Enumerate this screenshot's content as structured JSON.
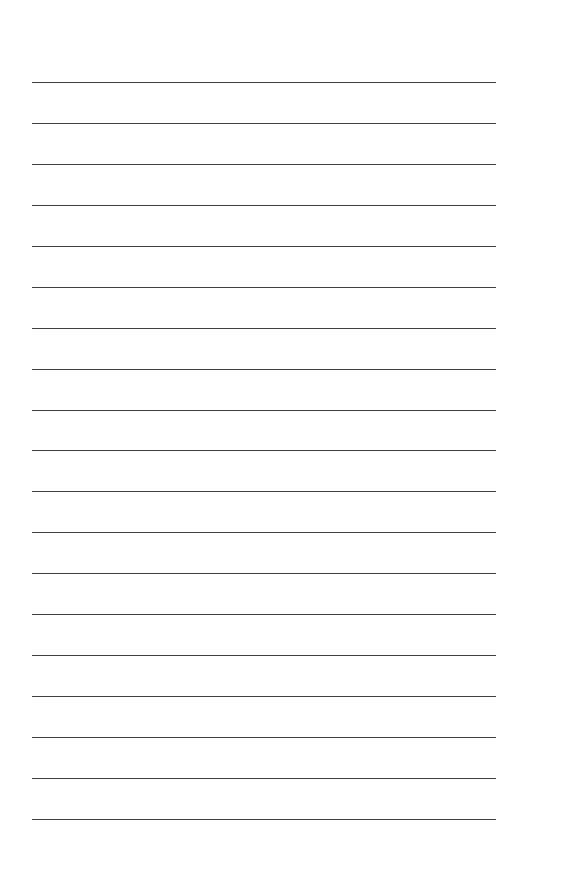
{
  "page": {
    "type": "lined-paper",
    "background": "#ffffff",
    "line_color": "#3f3f3f",
    "line_count": 19,
    "first_line_y": 82,
    "line_spacing": 40.94,
    "line_left": 32,
    "line_width": 464
  }
}
